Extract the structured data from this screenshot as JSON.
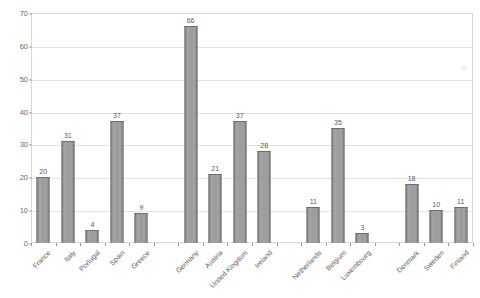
{
  "chart_data": {
    "type": "bar",
    "title": "",
    "xlabel": "",
    "ylabel": "",
    "ylim": [
      0,
      70
    ],
    "ytick_step": 10,
    "yticks": [
      0,
      10,
      20,
      30,
      40,
      50,
      60,
      70
    ],
    "grid": true,
    "legend": "none",
    "bar_color": "#9a9a9a",
    "bar_edge_color": "#6e6e6e",
    "gridline_color": "#e2e2e2",
    "frame_color": "#d8d8d8",
    "label_color": "#5c5c5c",
    "categories": [
      "France",
      "Italy",
      "Portugal",
      "Spain",
      "Greece",
      "",
      "Germany",
      "Austria",
      "United Kingdom",
      "Ireland",
      "",
      "Netherlands",
      "Belgium",
      "Luxembourg",
      "",
      "Denmark",
      "Sweden",
      "Finland"
    ],
    "values": [
      20,
      31,
      4,
      37,
      9,
      null,
      66,
      21,
      37,
      28,
      null,
      11,
      35,
      3,
      null,
      18,
      10,
      11
    ],
    "data_labels": [
      "20",
      "31",
      "4",
      "37",
      "9",
      "",
      "66",
      "21",
      "37",
      "28",
      "",
      "11",
      "35",
      "3",
      "",
      "18",
      "10",
      "11"
    ]
  }
}
